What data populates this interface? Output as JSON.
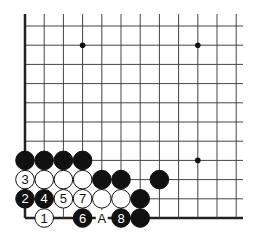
{
  "board": {
    "origin_x": 25,
    "origin_y": 26,
    "spacing": 19.2,
    "cols": 12,
    "rows": 11,
    "right_extent": 243,
    "edges": [
      "left",
      "bottom"
    ],
    "star_points": [
      [
        3,
        1
      ],
      [
        9,
        1
      ],
      [
        9,
        7
      ]
    ],
    "line_color": "#444444",
    "edge_color": "#222222"
  },
  "stones": [
    {
      "c": 0,
      "r": 7,
      "color": "black",
      "label": ""
    },
    {
      "c": 1,
      "r": 7,
      "color": "black",
      "label": ""
    },
    {
      "c": 2,
      "r": 7,
      "color": "black",
      "label": ""
    },
    {
      "c": 3,
      "r": 7,
      "color": "black",
      "label": ""
    },
    {
      "c": 0,
      "r": 8,
      "color": "white",
      "label": "3"
    },
    {
      "c": 1,
      "r": 8,
      "color": "white",
      "label": ""
    },
    {
      "c": 2,
      "r": 8,
      "color": "white",
      "label": ""
    },
    {
      "c": 3,
      "r": 8,
      "color": "white",
      "label": ""
    },
    {
      "c": 4,
      "r": 8,
      "color": "black",
      "label": ""
    },
    {
      "c": 5,
      "r": 8,
      "color": "black",
      "label": ""
    },
    {
      "c": 7,
      "r": 8,
      "color": "black",
      "label": ""
    },
    {
      "c": 0,
      "r": 9,
      "color": "black",
      "label": "2"
    },
    {
      "c": 1,
      "r": 9,
      "color": "black",
      "label": "4"
    },
    {
      "c": 2,
      "r": 9,
      "color": "white",
      "label": "5"
    },
    {
      "c": 3,
      "r": 9,
      "color": "white",
      "label": "7"
    },
    {
      "c": 4,
      "r": 9,
      "color": "white",
      "label": ""
    },
    {
      "c": 5,
      "r": 9,
      "color": "white",
      "label": ""
    },
    {
      "c": 6,
      "r": 9,
      "color": "black",
      "label": ""
    },
    {
      "c": 1,
      "r": 10,
      "color": "white",
      "label": "1"
    },
    {
      "c": 3,
      "r": 10,
      "color": "black",
      "label": "6"
    },
    {
      "c": 5,
      "r": 10,
      "color": "black",
      "label": "8"
    },
    {
      "c": 6,
      "r": 10,
      "color": "black",
      "label": ""
    }
  ],
  "markers": [
    {
      "c": 4,
      "r": 10,
      "label": "A"
    }
  ]
}
